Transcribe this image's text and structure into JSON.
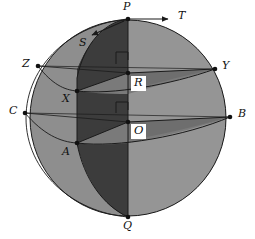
{
  "figure": {
    "type": "geometric-diagram"
  },
  "colors": {
    "outline": "#1a1a1a",
    "background": "#ffffff",
    "dark_shade": "#3c3c3c",
    "mid_shade": "#6d6d6d",
    "light_shade": "#8a8a8a",
    "lighter_shade": "#9a9a9a",
    "label_text": "#111111",
    "label_box_bg": "#ffffff"
  },
  "geometry": {
    "sphere_center": {
      "x": 128,
      "y": 118
    },
    "sphere_radius": 98
  },
  "points": [
    {
      "id": "P",
      "label": "P",
      "x": 128,
      "y": 19,
      "lx": 124,
      "ly": 2,
      "dot": true
    },
    {
      "id": "Q",
      "label": "Q",
      "x": 128,
      "y": 217,
      "lx": 124,
      "ly": 221,
      "dot": true
    },
    {
      "id": "O",
      "label": "O",
      "x": 128,
      "y": 122,
      "lx": 131,
      "ly": 125,
      "dot": true
    },
    {
      "id": "R",
      "label": "R",
      "x": 128,
      "y": 73,
      "lx": 131,
      "ly": 76,
      "dot": true
    },
    {
      "id": "X",
      "label": "X",
      "x": 77,
      "y": 91,
      "lx": 63,
      "ly": 95,
      "dot": true
    },
    {
      "id": "A",
      "label": "A",
      "x": 77,
      "y": 143,
      "lx": 63,
      "ly": 147,
      "dot": true
    },
    {
      "id": "Z",
      "label": "Z",
      "x": 38,
      "y": 66,
      "lx": 24,
      "ly": 59,
      "dot": true
    },
    {
      "id": "C",
      "label": "C",
      "x": 25,
      "y": 113,
      "lx": 11,
      "ly": 106,
      "dot": true
    },
    {
      "id": "Y",
      "label": "Y",
      "x": 215,
      "y": 69,
      "lx": 224,
      "ly": 62,
      "dot": true
    },
    {
      "id": "B",
      "label": "B",
      "x": 230,
      "y": 117,
      "lx": 239,
      "ly": 110,
      "dot": true
    },
    {
      "id": "T",
      "label": "T",
      "x": 170,
      "y": 20,
      "lx": 180,
      "ly": 11,
      "dot": false
    },
    {
      "id": "S",
      "label": "S",
      "x": 91,
      "y": 36,
      "lx": 83,
      "ly": 38,
      "dot": false
    }
  ],
  "arrows": [
    {
      "id": "T",
      "label": "T",
      "from_x": 128,
      "from_y": 19,
      "to_x": 172,
      "to_y": 19,
      "description": "tangent vector T at P pointing right"
    },
    {
      "id": "S",
      "label": "S",
      "from_x": 120,
      "from_y": 22,
      "to_x": 90,
      "to_y": 36,
      "description": "tangent vector S at P pointing down-left along the great circle"
    }
  ],
  "right_angle_marks": [
    {
      "at": "R",
      "x": 128,
      "y": 73,
      "size": 12,
      "description": "right angle above R"
    },
    {
      "at": "O",
      "x": 128,
      "y": 122,
      "size": 12,
      "description": "right angle above O"
    }
  ],
  "labels": {
    "P": "P",
    "Q": "Q",
    "O": "O",
    "R": "R",
    "X": "X",
    "A": "A",
    "Z": "Z",
    "C": "C",
    "Y": "Y",
    "B": "B",
    "T": "T",
    "S": "S"
  },
  "boxed_labels": [
    "R",
    "O"
  ]
}
